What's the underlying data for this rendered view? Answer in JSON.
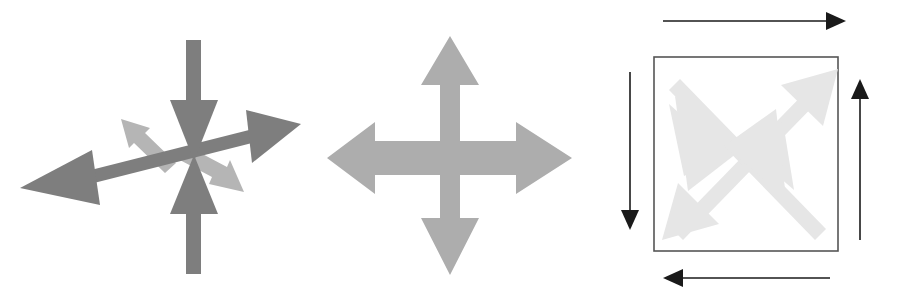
{
  "canvas": {
    "width": 903,
    "height": 299,
    "background": "#ffffff"
  },
  "palette": {
    "dark_gray": "#808080",
    "mid_gray": "#8a8a8a",
    "light_gray": "#b8b8b8",
    "very_light_gray": "#e3e3e3",
    "black": "#1a1a1a",
    "box_stroke": "#555555",
    "white": "#ffffff"
  },
  "figures": [
    {
      "id": "converging-arrows",
      "name": "Converging / diverging arrow star",
      "description": "Six-pointed gray arrow star: a long horizontal double-headed arrow pointing outward left and right, a vertical pair of arrows pointing inward toward the centre from top and bottom, plus two lighter diagonal arrows pointing up-left and down-right.",
      "arrows": [
        {
          "name": "arrow-left-outward",
          "direction": "left",
          "tone": "dark_gray",
          "points_outward": true
        },
        {
          "name": "arrow-right-outward",
          "direction": "right",
          "tone": "dark_gray",
          "points_outward": true
        },
        {
          "name": "arrow-top-inward",
          "direction": "down",
          "tone": "dark_gray",
          "points_outward": false
        },
        {
          "name": "arrow-bottom-inward",
          "direction": "up",
          "tone": "dark_gray",
          "points_outward": false
        },
        {
          "name": "arrow-diagonal-upleft",
          "direction": "up-left",
          "tone": "light_gray",
          "points_outward": true
        },
        {
          "name": "arrow-diagonal-downright",
          "direction": "down-right",
          "tone": "light_gray",
          "points_outward": true
        }
      ]
    },
    {
      "id": "four-way-cross-arrows",
      "name": "Four-way expansion cross",
      "description": "A symmetrical light-gray four-headed cross arrow pointing up, down, left and right — all heads point outward from the centre.",
      "arrows": [
        {
          "name": "arrow-up",
          "direction": "up",
          "tone": "light_gray",
          "points_outward": true
        },
        {
          "name": "arrow-down",
          "direction": "down",
          "tone": "light_gray",
          "points_outward": true
        },
        {
          "name": "arrow-left",
          "direction": "left",
          "tone": "light_gray",
          "points_outward": true
        },
        {
          "name": "arrow-right",
          "direction": "right",
          "tone": "light_gray",
          "points_outward": true
        }
      ]
    },
    {
      "id": "boxed-diagonal-arrows",
      "name": "Boxed diagonal arrows with rotational border arrows",
      "description": "A thin-outlined square containing two very light gray double-headed diagonal arrows crossing in an X. Four thin black arrows are placed outside the square, one per side, forming a counter-clockwise circulation: the top arrow points right, the right arrow points up, the bottom arrow points left, and the left arrow points down.",
      "box": {
        "name": "square-outline",
        "stroke": "#555555",
        "fill": "#ffffff"
      },
      "inner_arrows": [
        {
          "name": "diagonal-arrow-ne",
          "direction": "up-right",
          "tone": "very_light_gray"
        },
        {
          "name": "diagonal-arrow-sw",
          "direction": "down-left",
          "tone": "very_light_gray"
        },
        {
          "name": "diagonal-arrow-nw",
          "direction": "up-left",
          "tone": "very_light_gray"
        },
        {
          "name": "diagonal-arrow-se",
          "direction": "down-right",
          "tone": "very_light_gray"
        }
      ],
      "border_arrows": [
        {
          "name": "border-arrow-top",
          "side": "top",
          "direction": "right",
          "tone": "black"
        },
        {
          "name": "border-arrow-right",
          "side": "right",
          "direction": "up",
          "tone": "black"
        },
        {
          "name": "border-arrow-bottom",
          "side": "bottom",
          "direction": "left",
          "tone": "black"
        },
        {
          "name": "border-arrow-left",
          "side": "left",
          "direction": "down",
          "tone": "black"
        }
      ]
    }
  ]
}
